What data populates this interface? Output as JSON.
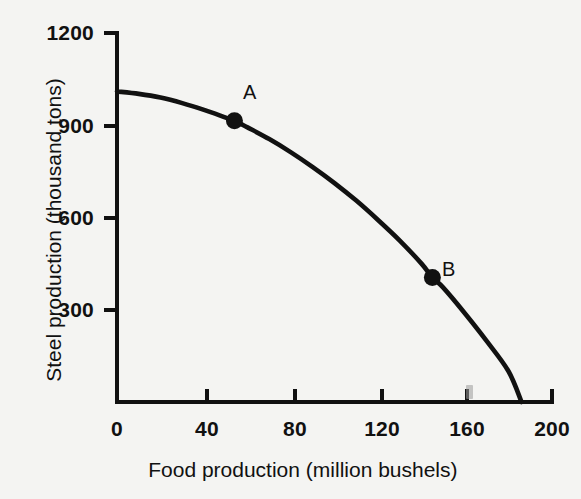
{
  "chart_data": {
    "type": "line",
    "title": "",
    "xlabel": "Food production (million bushels)",
    "ylabel": "Steel production (thousand tons)",
    "xlim": [
      0,
      200
    ],
    "ylim": [
      0,
      1200
    ],
    "xticks": [
      0,
      40,
      80,
      120,
      160,
      200
    ],
    "yticks": [
      0,
      300,
      600,
      900,
      1200
    ],
    "xtick_labels": [
      "0",
      "40",
      "80",
      "120",
      "160",
      "200"
    ],
    "ytick_labels": [
      "300",
      "600",
      "900",
      "1200"
    ],
    "grid": false,
    "legend": "none",
    "series": [
      {
        "name": "production possibilities frontier",
        "x": [
          0,
          10,
          20,
          30,
          40,
          50,
          54,
          60,
          70,
          80,
          90,
          100,
          110,
          120,
          130,
          140,
          145,
          150,
          160,
          170,
          180,
          186
        ],
        "y": [
          1010,
          1002,
          990,
          972,
          950,
          925,
          915,
          893,
          855,
          812,
          764,
          712,
          655,
          592,
          525,
          450,
          405,
          372,
          288,
          198,
          100,
          0
        ]
      }
    ],
    "annotations": [
      {
        "label": "A",
        "x": 54,
        "y": 915
      },
      {
        "label": "B",
        "x": 145,
        "y": 405
      }
    ],
    "axis_color": "#111111",
    "curve_color": "#111111",
    "marker_color": "#111111",
    "background_color": "#f4f4f2"
  },
  "labels": {
    "x_axis_title": "Food production (million bushels)",
    "y_axis_title": "Steel production (thousand tons)",
    "y_1200": "1200",
    "y_900": "900",
    "y_600": "600",
    "y_300": "300",
    "x_0": "0",
    "x_40": "40",
    "x_80": "80",
    "x_120": "120",
    "x_160": "160",
    "x_200": "200",
    "point_a": "A",
    "point_b": "B"
  }
}
